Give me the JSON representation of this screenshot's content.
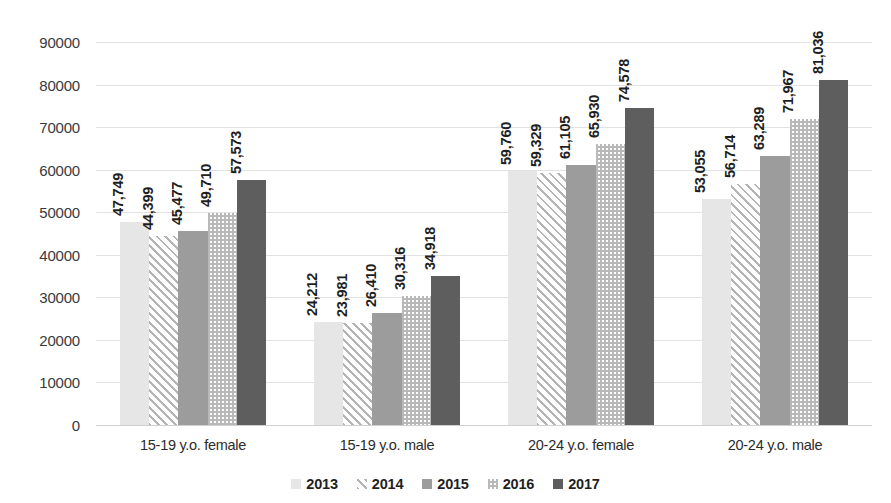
{
  "chart_data": {
    "type": "bar",
    "title": "",
    "subtitle": "",
    "xlabel": "",
    "ylabel": "",
    "ylim": [
      0,
      90000
    ],
    "ytick_values": [
      0,
      10000,
      20000,
      30000,
      40000,
      50000,
      60000,
      70000,
      80000,
      90000
    ],
    "ytick_labels": [
      "0",
      "10000",
      "20000",
      "30000",
      "40000",
      "50000",
      "60000",
      "70000",
      "80000",
      "90000"
    ],
    "grid": true,
    "legend_position": "bottom",
    "categories": [
      "15-19 y.o. female",
      "15-19 y.o. male",
      "20-24 y.o. female",
      "20-24 y.o. male"
    ],
    "series": [
      {
        "name": "2013",
        "pattern": "solid-light",
        "color": "#e6e6e6",
        "values": [
          47749,
          24212,
          59760,
          53055
        ],
        "labels": [
          "47,749",
          "24,212",
          "59,760",
          "53,055"
        ]
      },
      {
        "name": "2014",
        "pattern": "diagonal-stripes",
        "color": "#b4b4b4",
        "values": [
          44399,
          23981,
          59329,
          56714
        ],
        "labels": [
          "44,399",
          "23,981",
          "59,329",
          "56,714"
        ]
      },
      {
        "name": "2015",
        "pattern": "solid-medium",
        "color": "#9c9c9c",
        "values": [
          45477,
          26410,
          61105,
          63289
        ],
        "labels": [
          "45,477",
          "26,410",
          "61,105",
          "63,289"
        ]
      },
      {
        "name": "2016",
        "pattern": "checkerboard",
        "color": "#b8b8b8",
        "values": [
          49710,
          30316,
          65930,
          71967
        ],
        "labels": [
          "49,710",
          "30,316",
          "65,930",
          "71,967"
        ]
      },
      {
        "name": "2017",
        "pattern": "solid-dark",
        "color": "#5e5e5e",
        "values": [
          57573,
          34918,
          74578,
          81036
        ],
        "labels": [
          "57,573",
          "34,918",
          "74,578",
          "81,036"
        ]
      }
    ]
  },
  "legend": {
    "items": [
      {
        "label": "2013"
      },
      {
        "label": "2014"
      },
      {
        "label": "2015"
      },
      {
        "label": "2016"
      },
      {
        "label": "2017"
      }
    ]
  }
}
